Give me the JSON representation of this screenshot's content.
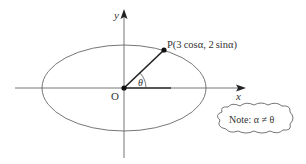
{
  "diagram": {
    "axes": {
      "x_label": "x",
      "y_label": "y",
      "origin_label": "O"
    },
    "ellipse": {
      "semi_major": 3,
      "semi_minor": 2
    },
    "point": {
      "label": "P(3 cosα, 2 sinα)"
    },
    "angle": {
      "label": "θ"
    },
    "note": {
      "text": "Note: α ≠ θ"
    },
    "colors": {
      "stroke": "#555555",
      "point": "#111111",
      "text": "#333333"
    }
  }
}
